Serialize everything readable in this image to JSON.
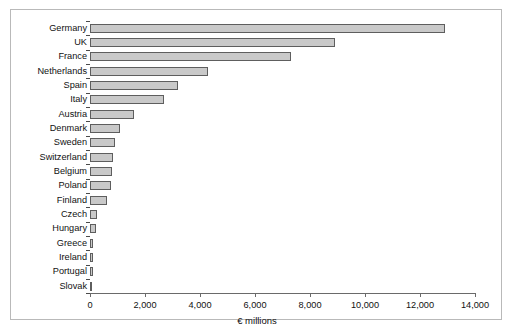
{
  "chart_data": {
    "type": "bar",
    "orientation": "horizontal",
    "title": "",
    "subtitle": "",
    "xlabel": "€ millions",
    "ylabel": "",
    "xlim": [
      0,
      14000
    ],
    "xticks": [
      0,
      2000,
      4000,
      6000,
      8000,
      10000,
      12000,
      14000
    ],
    "xtick_labels": [
      "0",
      "2,000",
      "4,000",
      "6,000",
      "8,000",
      "10,000",
      "12,000",
      "14,000"
    ],
    "grid": false,
    "legend": null,
    "legend_position": "none",
    "categories": [
      "Germany",
      "UK",
      "France",
      "Netherlands",
      "Spain",
      "Italy",
      "Austria",
      "Denmark",
      "Sweden",
      "Switzerland",
      "Belgium",
      "Poland",
      "Finland",
      "Czech",
      "Hungary",
      "Greece",
      "Ireland",
      "Portugal",
      "Slovak"
    ],
    "values": [
      12900,
      8900,
      7300,
      4300,
      3200,
      2700,
      1600,
      1100,
      900,
      850,
      800,
      750,
      600,
      250,
      220,
      120,
      110,
      100,
      90
    ],
    "bar_color": "#c9c9c9",
    "bar_edge_color": "#5e5e5e"
  },
  "figure": {
    "frame_color": "#b9b9b9",
    "background": "#ffffff"
  }
}
